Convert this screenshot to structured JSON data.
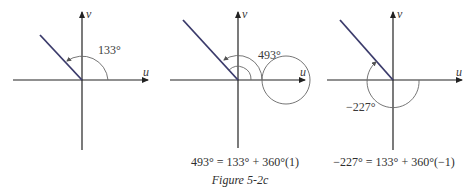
{
  "figure": {
    "caption": "Figure 5-2c",
    "axis_labels": {
      "horizontal": "u",
      "vertical": "v"
    },
    "colors": {
      "ray": "#3b3b6b",
      "axis": "#222222",
      "arc": "#666666",
      "text": "#3a3a3a"
    },
    "panels": [
      {
        "angle_label": "133°",
        "angle_deg": 133,
        "equation": ""
      },
      {
        "angle_label": "493°",
        "angle_deg": 493,
        "equation": "493° = 133° + 360°(1)"
      },
      {
        "angle_label": "−227°",
        "angle_deg": -227,
        "equation": "−227° = 133° + 360°(−1)"
      }
    ]
  }
}
